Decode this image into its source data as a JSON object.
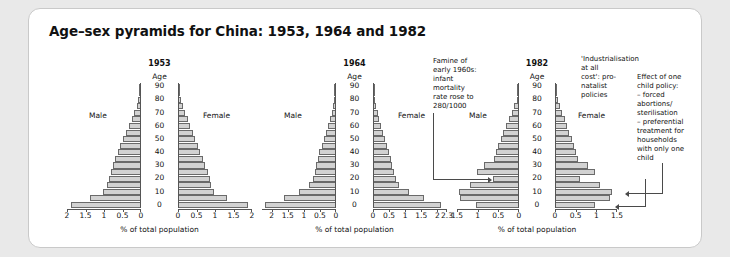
{
  "title": "Age–sex pyramids for China: 1953, 1964 and 1982",
  "axis": {
    "age_label": "Age",
    "x_label": "% of total population",
    "male_label": "Male",
    "female_label": "Female",
    "age_ticks": [
      "0",
      "10",
      "20",
      "30",
      "40",
      "50",
      "60",
      "70",
      "80",
      "90"
    ]
  },
  "annotations": {
    "famine": "Famine of\nearly 1960s:\ninfant\nmortality\nrate rose to\n280/1000",
    "industrialisation": "'Industrialisation\nat all\ncost': pro-\nnatalist\npolicies",
    "one_child": "Effect of one\nchild policy:\n– forced\nabortions/\nsterilisation\n– preferential\ntreatment for\nhouseholds\nwith only one\nchild"
  },
  "chart_data": [
    {
      "type": "bar",
      "title": "1953",
      "xlabel": "% of total population",
      "ylabel": "Age",
      "xlim": [
        0,
        2
      ],
      "xticks": [
        "2",
        "1.5",
        "1",
        "0.5",
        "0"
      ],
      "xticks_right": [
        "0",
        "0.5",
        "1",
        "1.5",
        "2"
      ],
      "age_bands": [
        "0",
        "5",
        "10",
        "15",
        "20",
        "25",
        "30",
        "35",
        "40",
        "45",
        "50",
        "55",
        "60",
        "65",
        "70",
        "75",
        "80",
        "85",
        "90"
      ],
      "series": [
        {
          "name": "Male",
          "values": [
            1.9,
            1.37,
            1.03,
            0.93,
            0.86,
            0.8,
            0.75,
            0.7,
            0.63,
            0.56,
            0.48,
            0.41,
            0.33,
            0.25,
            0.18,
            0.12,
            0.07,
            0.03,
            0.01
          ]
        },
        {
          "name": "Female",
          "values": [
            1.88,
            1.33,
            0.98,
            0.89,
            0.86,
            0.8,
            0.73,
            0.68,
            0.6,
            0.53,
            0.46,
            0.4,
            0.33,
            0.26,
            0.19,
            0.13,
            0.08,
            0.04,
            0.01
          ]
        }
      ]
    },
    {
      "type": "bar",
      "title": "1964",
      "xlabel": "% of total population",
      "ylabel": "Age",
      "xlim": [
        0,
        2.3
      ],
      "xticks": [
        "2",
        "1.5",
        "1",
        "0.5",
        "0"
      ],
      "xticks_right": [
        "0",
        "0.5",
        "1",
        "1.5",
        "2",
        "2.3"
      ],
      "age_bands": [
        "0",
        "5",
        "10",
        "15",
        "20",
        "25",
        "30",
        "35",
        "40",
        "45",
        "50",
        "55",
        "60",
        "65",
        "70",
        "75",
        "80",
        "85",
        "90"
      ],
      "series": [
        {
          "name": "Male",
          "values": [
            2.22,
            1.62,
            1.15,
            0.83,
            0.72,
            0.66,
            0.62,
            0.57,
            0.52,
            0.45,
            0.38,
            0.31,
            0.25,
            0.19,
            0.13,
            0.08,
            0.05,
            0.02,
            0.01
          ]
        },
        {
          "name": "Female",
          "values": [
            2.1,
            1.57,
            1.12,
            0.8,
            0.7,
            0.64,
            0.6,
            0.55,
            0.5,
            0.44,
            0.38,
            0.32,
            0.26,
            0.2,
            0.14,
            0.09,
            0.05,
            0.03,
            0.01
          ]
        }
      ]
    },
    {
      "type": "bar",
      "title": "1982",
      "xlabel": "% of total population",
      "ylabel": "Age",
      "xlim": [
        0,
        1.5
      ],
      "xticks": [
        "1.5",
        "1",
        "0.5",
        "0"
      ],
      "xticks_right": [
        "0",
        "0.5",
        "1",
        "1.5"
      ],
      "age_bands": [
        "0",
        "5",
        "10",
        "15",
        "20",
        "25",
        "30",
        "35",
        "40",
        "45",
        "50",
        "55",
        "60",
        "65",
        "70",
        "75",
        "80",
        "85",
        "90"
      ],
      "series": [
        {
          "name": "Male",
          "values": [
            1.03,
            1.43,
            1.46,
            1.18,
            0.63,
            1.02,
            0.85,
            0.61,
            0.56,
            0.5,
            0.44,
            0.38,
            0.31,
            0.24,
            0.17,
            0.11,
            0.06,
            0.03,
            0.01
          ]
        },
        {
          "name": "Female",
          "values": [
            0.97,
            1.33,
            1.37,
            1.1,
            0.6,
            0.97,
            0.8,
            0.56,
            0.5,
            0.45,
            0.4,
            0.35,
            0.29,
            0.23,
            0.17,
            0.12,
            0.07,
            0.03,
            0.01
          ]
        }
      ]
    }
  ]
}
